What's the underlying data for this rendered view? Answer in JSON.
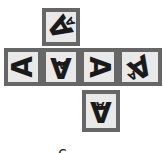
{
  "figure": {
    "faces": [
      {
        "id": "top",
        "big": "A",
        "small": "A"
      },
      {
        "id": "left",
        "big": "A"
      },
      {
        "id": "center-left",
        "big": "A",
        "small": "A"
      },
      {
        "id": "center-right",
        "big": "A"
      },
      {
        "id": "right",
        "big": "A",
        "small": "A"
      },
      {
        "id": "bottom",
        "big": "A",
        "small": "A"
      }
    ],
    "option_label": "c"
  },
  "colors": {
    "border": "#666666",
    "face_fill": "#e9e9e9",
    "glyph": "#1a1a1a"
  }
}
